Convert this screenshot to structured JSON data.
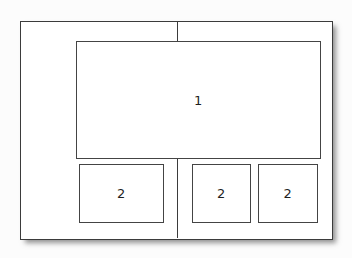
{
  "diagram": {
    "title": "",
    "type": "layout-wireframe",
    "canvas": {
      "background_color": "#fcfcfc",
      "width": 352,
      "height": 258
    },
    "page_frame": {
      "name": "page-frame",
      "border_color": "#3b3b3b",
      "fill_color": "#ffffff",
      "has_drop_shadow": true
    },
    "divider": {
      "name": "column-divider",
      "orientation": "vertical",
      "color": "#3b3b3b"
    },
    "regions": [
      {
        "name": "region-main",
        "label": "1",
        "size": "large",
        "position": "top"
      },
      {
        "name": "region-sub-left",
        "label": "2",
        "size": "wide",
        "position": "bottom-left"
      },
      {
        "name": "region-sub-middle",
        "label": "2",
        "size": "square",
        "position": "bottom-middle"
      },
      {
        "name": "region-sub-right",
        "label": "2",
        "size": "square",
        "position": "bottom-right"
      }
    ]
  }
}
